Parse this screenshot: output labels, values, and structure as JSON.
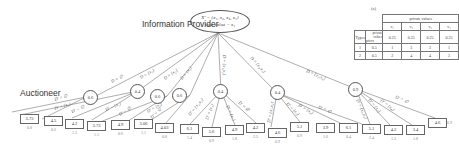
{
  "diagram": {
    "root": {
      "label": "Information Provider",
      "line1": "X' = {x₁, x₂, x₃, x₄}",
      "line2": "true value = x₄"
    },
    "auctioneer_label": "Auctioneer",
    "root_edges": [
      "D = ∅",
      "D = {x₁}",
      "D = {x₂}",
      "D = {x₃}",
      "D = {x₁,x₂}",
      "D = {x₂,x₃}",
      "D = {x₃,x₄}"
    ],
    "circles": [
      "0.6",
      "0.4",
      "0.6",
      "0.6",
      "0.4",
      "0.4",
      "0.9"
    ],
    "leaf_edges": [
      "D' = ∅",
      "D' = {x₁}",
      "D' = ∅",
      "D' = {x₁}",
      "D' = ∅",
      "D' = {x₂}",
      "D' = ∅",
      "D' = {x₁,x₂}",
      "D' = {x₁}",
      "D' = {x₂}",
      "D' = ∅",
      "D' = {x₂,x₃}",
      "D' = {x₃}",
      "D' = {x₂}",
      "D' = ∅",
      "D' = {x₃,x₄}",
      "D' = {x₃}",
      "D' = {x₄}",
      "D' = ∅"
    ],
    "leaves": [
      {
        "value": "3.73",
        "sub": "0.8"
      },
      {
        "value": "4.5",
        "sub": "0.6"
      },
      {
        "value": "4.2",
        "sub": "1.3"
      },
      {
        "value": "3.73",
        "sub": "1.1"
      },
      {
        "value": "4.9",
        "sub": "0.6"
      },
      {
        "value": "3.06",
        "sub": "1.1"
      },
      {
        "value": "4.03",
        "sub": "0.8"
      },
      {
        "value": "6.1",
        "sub": "1.4"
      },
      {
        "value": "5.6",
        "sub": "0.9"
      },
      {
        "value": "4.9",
        "sub": "1.8"
      },
      {
        "value": "4.2",
        "sub": "2.5"
      },
      {
        "value": "4.6",
        "sub": "0.9"
      },
      {
        "value": "5.1",
        "sub": "0.9"
      },
      {
        "value": "3.9",
        "sub": "1.6"
      },
      {
        "value": "6.1",
        "sub": "0.4"
      },
      {
        "value": "5.1",
        "sub": "2.4"
      },
      {
        "value": "4.2",
        "sub": "1.3"
      },
      {
        "value": "3.4",
        "sub": "1.8"
      },
      {
        "value": "4.6",
        "sub": "0.9"
      }
    ]
  },
  "table": {
    "caption": "(a)",
    "header": "private values",
    "columns": [
      "v₁",
      "v₂",
      "v₃",
      "v₄"
    ],
    "corner_top": "private values",
    "corner_bottom": "priors",
    "row_label": "Types",
    "priors": [
      "0.25",
      "0.25",
      "0.25",
      "0.25"
    ],
    "rows": [
      {
        "type": "1",
        "prob": "0.5",
        "values": [
          "1",
          "3",
          "3",
          "1"
        ]
      },
      {
        "type": "2",
        "prob": "0.5",
        "values": [
          "2",
          "4",
          "4",
          "3"
        ]
      }
    ]
  }
}
